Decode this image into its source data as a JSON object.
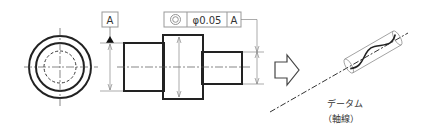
{
  "drawing": {
    "datum_label": "A",
    "fcf": {
      "symbol": "concentricity-icon",
      "tolerance": "φ0.05",
      "datum_ref": "A"
    },
    "result_caption_line1": "データム",
    "result_caption_line2": "（軸線）"
  },
  "colors": {
    "outline": "#222222",
    "thin_line": "#777777",
    "box_border": "#999999",
    "background": "#ffffff"
  }
}
